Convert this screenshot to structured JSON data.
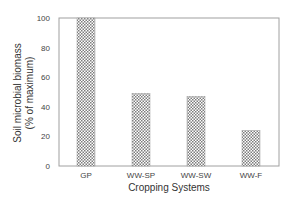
{
  "chart_data": {
    "type": "bar",
    "title": "",
    "xlabel": "Cropping Systems",
    "ylabel_lines": [
      "Soil microbial biomass",
      "(% of maximum)"
    ],
    "categories": [
      "GP",
      "WW-SP",
      "WW-SW",
      "WW-F"
    ],
    "values": [
      100,
      49,
      47,
      24
    ],
    "ylim": [
      0,
      100
    ],
    "yticks": [
      0,
      20,
      40,
      60,
      80,
      100
    ],
    "ytick_labels": [
      "0",
      "20",
      "40",
      "60",
      "80",
      "100"
    ],
    "grid": false,
    "legend": "none",
    "bar_fill": "crosshatch",
    "colors": {
      "bar_hatch": "#8a8a8a",
      "axis": "#999999",
      "text": "#444444"
    }
  }
}
